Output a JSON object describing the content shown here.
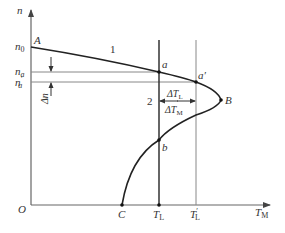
{
  "diagram": {
    "axes": {
      "y_label": "n",
      "x_label": "T",
      "x_label_sub": "M",
      "origin": "O"
    },
    "y_ticks": {
      "n0": "n",
      "n0_sub": "0",
      "na": "n",
      "na_sub": "a",
      "na_prime": "n",
      "na_prime_sub": "a",
      "na_prime_mark": "′"
    },
    "x_ticks": {
      "C": "C",
      "TL": "T",
      "TL_sub": "L",
      "TL_prime": "T",
      "TL_prime_sub": "L",
      "TL_prime_mark": "′"
    },
    "points": {
      "A": "A",
      "a": "a",
      "a_prime": "a′",
      "B": "B",
      "b": "b"
    },
    "curve_labels": {
      "curve1": "1",
      "curve2": "2"
    },
    "annotations": {
      "delta_n": "Δn",
      "delta_TL": "ΔT",
      "delta_TL_sub": "L",
      "delta_TM": "ΔT",
      "delta_TM_sub": "M"
    },
    "colors": {
      "curve": "#222222",
      "axis": "#666666",
      "guide": "#888888"
    }
  }
}
